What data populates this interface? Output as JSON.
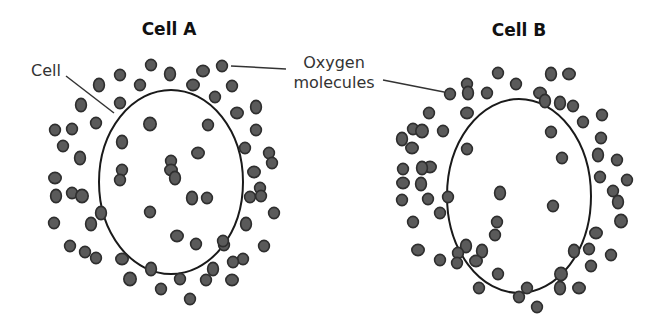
{
  "diagram": {
    "topic": "Diffusion of oxygen molecules into cells",
    "colors": {
      "background": "#ffffff",
      "membrane": "#1a1a1a",
      "molecule_fill": "#5a5a5a",
      "molecule_stroke": "#2e2e2e",
      "label_text": "#333333",
      "title_text": "#111111"
    },
    "labels": {
      "cell_label": "Cell",
      "oxygen_label_line1": "Oxygen",
      "oxygen_label_line2": "molecules"
    },
    "cells": [
      {
        "id": "cell-a",
        "title": "Cell A",
        "membrane": {
          "cx": 171,
          "cy": 182,
          "rx": 72,
          "ry": 92
        },
        "molecules_inside_count": 12,
        "molecules_outside_count": 62,
        "molecules": [
          [
            151,
            65
          ],
          [
            170,
            74
          ],
          [
            203,
            71
          ],
          [
            222,
            66
          ],
          [
            120,
            75
          ],
          [
            99,
            85
          ],
          [
            140,
            85
          ],
          [
            193,
            85
          ],
          [
            232,
            86
          ],
          [
            81,
            105
          ],
          [
            120,
            103
          ],
          [
            215,
            97
          ],
          [
            237,
            113
          ],
          [
            256,
            107
          ],
          [
            55,
            130
          ],
          [
            72,
            129
          ],
          [
            96,
            123
          ],
          [
            150,
            124
          ],
          [
            208,
            125
          ],
          [
            256,
            130
          ],
          [
            63,
            146
          ],
          [
            122,
            142
          ],
          [
            198,
            153
          ],
          [
            245,
            148
          ],
          [
            269,
            153
          ],
          [
            80,
            158
          ],
          [
            171,
            161
          ],
          [
            254,
            172
          ],
          [
            272,
            163
          ],
          [
            56,
            196
          ],
          [
            72,
            193
          ],
          [
            122,
            170
          ],
          [
            171,
            170
          ],
          [
            192,
            198
          ],
          [
            207,
            198
          ],
          [
            260,
            188
          ],
          [
            54,
            223
          ],
          [
            82,
            196
          ],
          [
            150,
            212
          ],
          [
            250,
            197
          ],
          [
            261,
            196
          ],
          [
            101,
            213
          ],
          [
            177,
            236
          ],
          [
            196,
            244
          ],
          [
            224,
            245
          ],
          [
            246,
            224
          ],
          [
            274,
            213
          ],
          [
            55,
            178
          ],
          [
            70,
            246
          ],
          [
            91,
            224
          ],
          [
            85,
            252
          ],
          [
            96,
            258
          ],
          [
            122,
            259
          ],
          [
            151,
            269
          ],
          [
            223,
            241
          ],
          [
            243,
            259
          ],
          [
            264,
            246
          ],
          [
            130,
            279
          ],
          [
            161,
            289
          ],
          [
            180,
            279
          ],
          [
            206,
            280
          ],
          [
            213,
            269
          ],
          [
            232,
            280
          ],
          [
            190,
            299
          ],
          [
            233,
            262
          ],
          [
            175,
            178
          ],
          [
            120,
            180
          ]
        ]
      },
      {
        "id": "cell-b",
        "title": "Cell B",
        "membrane": {
          "cx": 519,
          "cy": 196,
          "rx": 72,
          "ry": 97
        },
        "molecules_inside_count": 6,
        "molecules_outside_count": 64,
        "molecules": [
          [
            498,
            73
          ],
          [
            551,
            74
          ],
          [
            569,
            74
          ],
          [
            467,
            84
          ],
          [
            516,
            84
          ],
          [
            468,
            93
          ],
          [
            487,
            93
          ],
          [
            540,
            93
          ],
          [
            450,
            94
          ],
          [
            545,
            101
          ],
          [
            573,
            106
          ],
          [
            429,
            113
          ],
          [
            467,
            113
          ],
          [
            560,
            103
          ],
          [
            583,
            122
          ],
          [
            602,
            115
          ],
          [
            413,
            129
          ],
          [
            422,
            131
          ],
          [
            443,
            131
          ],
          [
            551,
            132
          ],
          [
            601,
            138
          ],
          [
            402,
            139
          ],
          [
            412,
            148
          ],
          [
            467,
            149
          ],
          [
            562,
            158
          ],
          [
            598,
            155
          ],
          [
            617,
            160
          ],
          [
            430,
            167
          ],
          [
            403,
            169
          ],
          [
            422,
            168
          ],
          [
            600,
            177
          ],
          [
            627,
            180
          ],
          [
            403,
            183
          ],
          [
            421,
            184
          ],
          [
            428,
            199
          ],
          [
            448,
            197
          ],
          [
            613,
            191
          ],
          [
            621,
            221
          ],
          [
            402,
            200
          ],
          [
            497,
            222
          ],
          [
            553,
            206
          ],
          [
            618,
            202
          ],
          [
            596,
            233
          ],
          [
            413,
            222
          ],
          [
            440,
            213
          ],
          [
            466,
            246
          ],
          [
            589,
            249
          ],
          [
            418,
            250
          ],
          [
            458,
            253
          ],
          [
            482,
            251
          ],
          [
            440,
            260
          ],
          [
            457,
            263
          ],
          [
            476,
            261
          ],
          [
            574,
            251
          ],
          [
            591,
            266
          ],
          [
            611,
            255
          ],
          [
            498,
            274
          ],
          [
            561,
            274
          ],
          [
            519,
            297
          ],
          [
            479,
            288
          ],
          [
            527,
            288
          ],
          [
            560,
            288
          ],
          [
            579,
            288
          ],
          [
            537,
            307
          ],
          [
            495,
            235
          ],
          [
            500,
            193
          ]
        ]
      }
    ],
    "annotations": [
      {
        "text_ref": "cell_label",
        "from": [
          35,
          65
        ],
        "to": [
          114,
          115
        ]
      },
      {
        "text_ref": "oxygen_to_cell_a",
        "from": [
          285,
          70
        ],
        "to": [
          232,
          66
        ]
      },
      {
        "text_ref": "oxygen_to_cell_b",
        "from": [
          382,
          79
        ],
        "to": [
          444,
          92
        ]
      }
    ]
  }
}
